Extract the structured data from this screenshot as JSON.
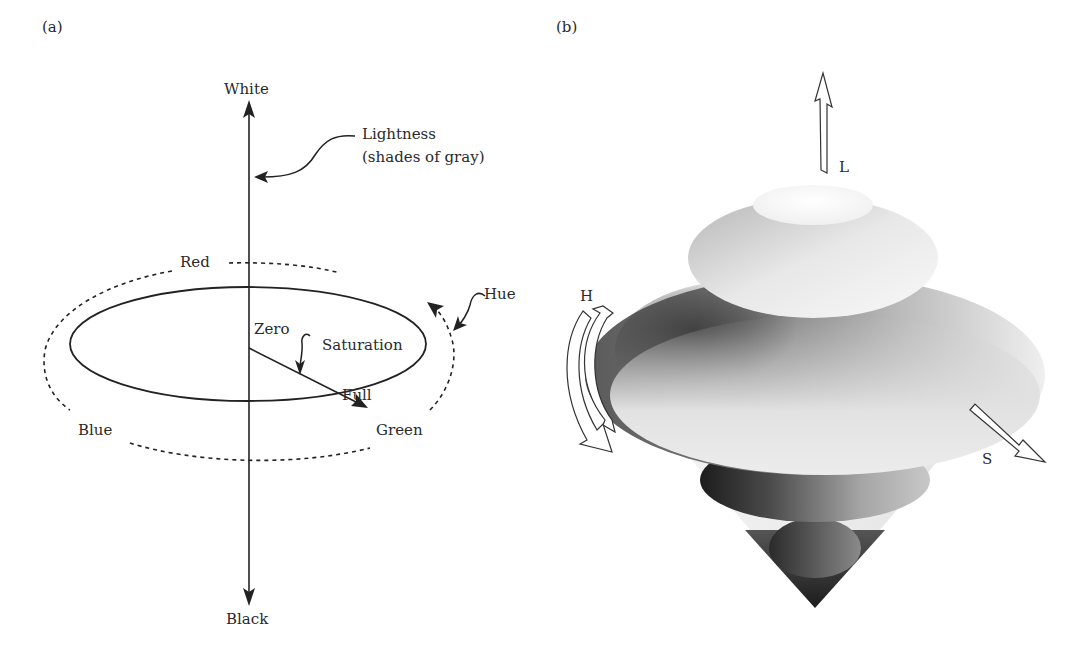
{
  "figure": {
    "panel_a": {
      "label": "(a)",
      "axis": {
        "top": "White",
        "bottom": "Black"
      },
      "annotations": {
        "lightness_line1": "Lightness",
        "lightness_line2": "(shades of gray)",
        "hue": "Hue",
        "saturation": "Saturation",
        "zero": "Zero",
        "full": "Full"
      },
      "hue_labels": {
        "red": "Red",
        "blue": "Blue",
        "green": "Green"
      }
    },
    "panel_b": {
      "label": "(b)",
      "arrows": {
        "lightness": "L",
        "hue": "H",
        "saturation": "S"
      }
    }
  }
}
